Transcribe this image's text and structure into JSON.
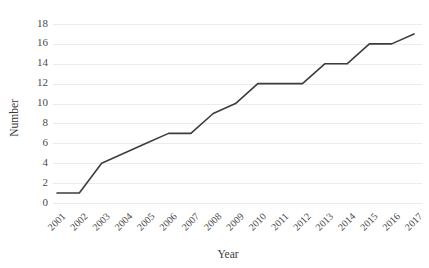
{
  "chart_data": {
    "type": "line",
    "title": "",
    "xlabel": "Year",
    "ylabel": "Number",
    "categories": [
      "2001",
      "2002",
      "2003",
      "2004",
      "2005",
      "2006",
      "2007",
      "2008",
      "2009",
      "2010",
      "2011",
      "2012",
      "2013",
      "2014",
      "2015",
      "2016",
      "2017"
    ],
    "values": [
      1,
      1,
      4,
      5,
      6,
      7,
      7,
      9,
      10,
      12,
      12,
      12,
      14,
      14,
      16,
      16,
      17
    ],
    "yticks": [
      0,
      2,
      4,
      6,
      8,
      10,
      12,
      14,
      16,
      18
    ],
    "ylim": [
      0,
      18
    ],
    "grid": "horizontal",
    "legend": "none",
    "series_color": "#3d3d3d",
    "grid_color": "#ebebeb",
    "background_color": "#ffffff"
  }
}
